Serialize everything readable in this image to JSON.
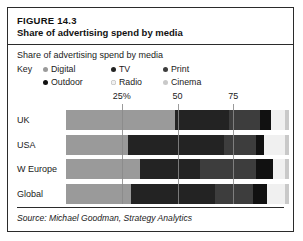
{
  "figure": {
    "number_label": "FIGURE 14.3",
    "title": "Share of advertising spend by media",
    "subtitle": "Share of advertising spend by media",
    "source": "Source: Michael Goodman, Strategy Analytics"
  },
  "legend": {
    "key_label": "Key",
    "items": [
      {
        "label": "Digital",
        "color": "#9a9a9a"
      },
      {
        "label": "TV",
        "color": "#232323"
      },
      {
        "label": "Print",
        "color": "#3d3d3d"
      },
      {
        "label": "Outdoor",
        "color": "#111111"
      },
      {
        "label": "Radio",
        "color": "#f0f0f0"
      },
      {
        "label": "Cinema",
        "color": "#c9c9c9"
      }
    ]
  },
  "chart_data": {
    "type": "bar",
    "orientation": "horizontal",
    "stacked": true,
    "stacked_percent": true,
    "title": "Share of advertising spend by media",
    "xlabel": "",
    "ylabel": "",
    "xlim": [
      0,
      100
    ],
    "xticks": [
      25,
      50,
      75
    ],
    "xtick_labels": [
      "25%",
      "50",
      "75"
    ],
    "grid": true,
    "legend_position": "top",
    "categories": [
      "UK",
      "USA",
      "W Europe",
      "Global"
    ],
    "series": [
      {
        "name": "Digital",
        "color": "#9a9a9a",
        "values": [
          49,
          28,
          33,
          29
        ]
      },
      {
        "name": "TV",
        "color": "#232323",
        "values": [
          24,
          43,
          27,
          38
        ]
      },
      {
        "name": "Print",
        "color": "#3d3d3d",
        "values": [
          14,
          14,
          25,
          17
        ]
      },
      {
        "name": "Outdoor",
        "color": "#111111",
        "values": [
          5,
          4,
          8,
          6
        ]
      },
      {
        "name": "Radio",
        "color": "#f0f0f0",
        "values": [
          6,
          9,
          5,
          8
        ]
      },
      {
        "name": "Cinema",
        "color": "#c9c9c9",
        "values": [
          2,
          2,
          2,
          2
        ]
      }
    ]
  }
}
